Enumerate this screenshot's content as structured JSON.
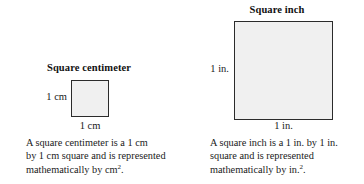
{
  "figure": {
    "background_color": "#ffffff",
    "square_fill_color": "#f0f0f0",
    "square_border_color": "#2b2b2b"
  },
  "panels": [
    {
      "id": "square-centimeter",
      "heading": "Square centimeter",
      "side_label": "1 cm",
      "bottom_label": "1 cm",
      "caption_lines": [
        "A square centimeter is a 1 cm",
        "by 1 cm square and is represented",
        "mathematically by cm"
      ],
      "caption_exponent": "2",
      "caption_terminator": ".",
      "square_size_px": 37
    },
    {
      "id": "square-inch",
      "heading": "Square inch",
      "side_label": "1 in.",
      "bottom_label": "1 in.",
      "caption_lines": [
        "A square inch is a 1 in. by 1 in.",
        "square and is represented",
        "mathematically by in."
      ],
      "caption_exponent": "2",
      "caption_terminator": ".",
      "square_size_px": 99
    }
  ]
}
